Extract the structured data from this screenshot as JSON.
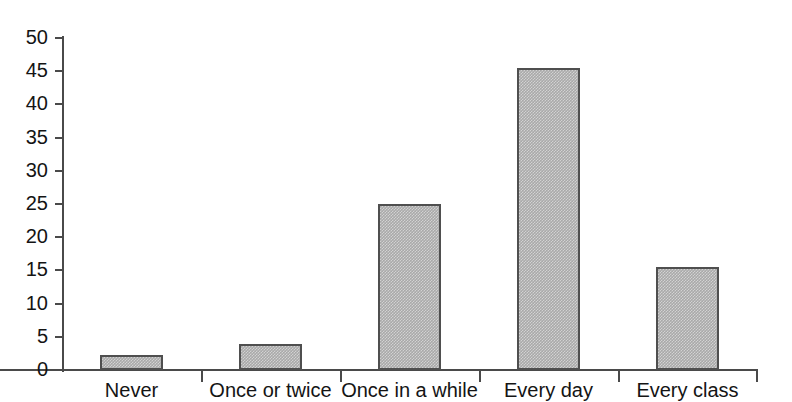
{
  "chart_data": {
    "type": "bar",
    "title": "",
    "xlabel": "",
    "ylabel": "",
    "ylim": [
      0,
      50
    ],
    "ytick_step": 5,
    "grid": false,
    "legend": "none",
    "categories": [
      "Never",
      "Once or twice",
      "Once in a while",
      "Every day",
      "Every class"
    ],
    "values": [
      2.3,
      3.9,
      25.0,
      45.5,
      15.5
    ],
    "ytick_labels": [
      "50",
      "45",
      "40",
      "35",
      "30",
      "25",
      "20",
      "15",
      "10",
      "5",
      "0"
    ],
    "ytick_values": [
      50,
      45,
      40,
      35,
      30,
      25,
      20,
      15,
      10,
      5,
      0
    ],
    "series": [
      {
        "name": "",
        "values": [
          2.3,
          3.9,
          25.0,
          45.5,
          15.5
        ]
      }
    ],
    "bar_fill_color": "#a9a9a9",
    "bar_border_color": "#4f4f4f",
    "axis_color": "#4a4a4a",
    "background_color": "#ffffff"
  }
}
